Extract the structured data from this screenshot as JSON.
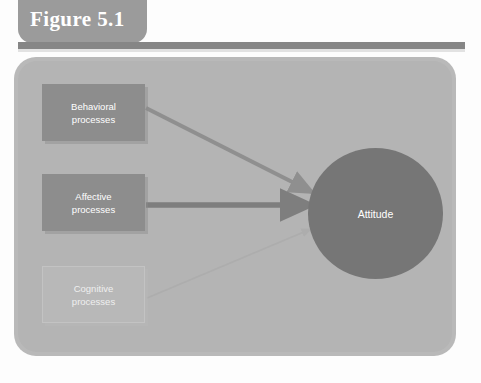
{
  "figure": {
    "tab_label": "Figure 5.1"
  },
  "diagram": {
    "type": "flow-diagram",
    "nodes": [
      {
        "id": "behavioral",
        "label": "Behavioral\nprocesses",
        "line1": "Behavioral",
        "line2": "processes",
        "shape": "rectangle",
        "emphasis": "strong",
        "color": "#8d8d8d",
        "text_color": "#ffffff"
      },
      {
        "id": "affective",
        "label": "Affective\nprocesses",
        "line1": "Affective",
        "line2": "processes",
        "shape": "rectangle",
        "emphasis": "strong",
        "color": "#8d8d8d",
        "text_color": "#ffffff"
      },
      {
        "id": "cognitive",
        "label": "Cognitive\nprocesses",
        "line1": "Cognitive",
        "line2": "processes",
        "shape": "rectangle",
        "emphasis": "faint",
        "color": "#b4b4b4",
        "text_color": "#efefef"
      },
      {
        "id": "attitude",
        "label": "Attitude",
        "shape": "circle",
        "emphasis": "strong",
        "color": "#767676",
        "text_color": "#ffffff"
      }
    ],
    "edges": [
      {
        "from": "behavioral",
        "to": "attitude",
        "weight": "medium",
        "color": "#8f8f8f"
      },
      {
        "from": "affective",
        "to": "attitude",
        "weight": "heavy",
        "color": "#7e7e7e"
      },
      {
        "from": "cognitive",
        "to": "attitude",
        "weight": "light",
        "color": "#b0b0b0"
      }
    ],
    "panel_color": "#b4b4b4",
    "rule_color": "#868686",
    "tab_color": "#9b9b9b"
  }
}
